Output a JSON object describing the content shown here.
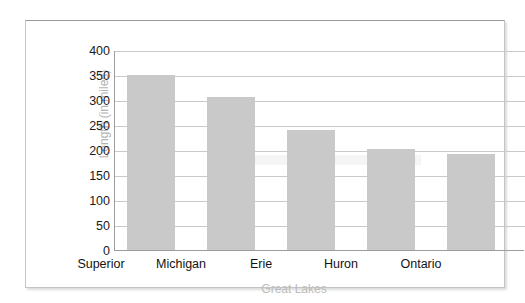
{
  "chart_data": {
    "type": "bar",
    "title": "",
    "subtitle": "",
    "xlabel": "Great Lakes",
    "ylabel": "Length (in miles)",
    "categories": [
      "Superior",
      "Michigan",
      "Erie",
      "Huron",
      "Ontario"
    ],
    "values": [
      352,
      307,
      242,
      203,
      192
    ],
    "ylim": [
      0,
      400
    ],
    "ytick_labels": [
      "400",
      "350",
      "300",
      "250",
      "200",
      "150",
      "100",
      "50",
      "0"
    ],
    "ytick_values": [
      400,
      350,
      300,
      250,
      200,
      150,
      100,
      50,
      0
    ],
    "grid": true,
    "legend": false,
    "legend_position": "none",
    "series": [
      {
        "name": "Length (in miles)",
        "values": [
          352,
          307,
          242,
          203,
          192
        ]
      }
    ],
    "colors": {
      "bar_fill": "#c9c9c9",
      "gridline": "#c9c9c9",
      "axis_line": "#9d9d9d",
      "tick_label": "#1b1b1b",
      "axis_title": "#bdbdbd",
      "frame_border": "#c4c4c4",
      "background": "#ffffff"
    }
  }
}
